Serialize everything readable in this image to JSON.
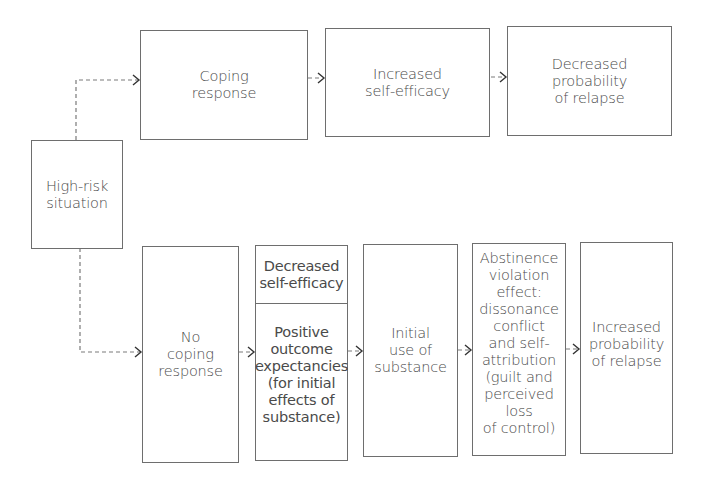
{
  "diagram": {
    "start": {
      "label": "High-risk\nsituation"
    },
    "top_path": [
      {
        "id": "coping-response",
        "label": "Coping\nresponse"
      },
      {
        "id": "increased-self-efficacy",
        "label": "Increased\nself-efficacy"
      },
      {
        "id": "decreased-probability",
        "label": "Decreased\nprobability\nof relapse"
      }
    ],
    "bottom_path": [
      {
        "id": "no-coping-response",
        "label": "No\ncoping\nresponse"
      },
      {
        "id": "decreased-self-efficacy",
        "label": "Decreased\nself-efficacy"
      },
      {
        "id": "positive-outcome-expectancies",
        "label": "Positive\noutcome\nexpectancies\n(for initial\neffects of\nsubstance)"
      },
      {
        "id": "initial-use",
        "label": "Initial\nuse of\nsubstance"
      },
      {
        "id": "abstinence-violation-effect",
        "label": "Abstinence\nviolation\neffect:\ndissonance\nconflict\nand self-\nattribution\n(guilt and\nperceived loss\nof control)"
      },
      {
        "id": "increased-probability",
        "label": "Increased\nprobability\nof relapse"
      }
    ],
    "colors": {
      "border": "#6e6e6e",
      "text": "#4a4a4a",
      "dashed_line": "#7a7a7a",
      "arrowhead": "#333333"
    }
  }
}
